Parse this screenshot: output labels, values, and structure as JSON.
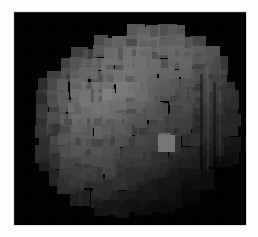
{
  "figure": {
    "kind": "astronomical-image",
    "title": "",
    "caption": "",
    "background_color": "#ffffff",
    "plate_color": "#000000",
    "plate": {
      "x": 14,
      "y": 12,
      "width": 232,
      "height": 213
    },
    "colormap": "grayscale"
  },
  "chart_data": {
    "type": "heatmap",
    "title": "",
    "xlabel": "",
    "ylabel": "",
    "colormap": "grayscale",
    "grid": false,
    "legend": "none",
    "block_size": 11,
    "grid_cols": 21,
    "grid_rows": 19,
    "value_range": [
      0,
      255
    ],
    "values": [
      [
        0,
        0,
        0,
        0,
        0,
        0,
        0,
        0,
        0,
        0,
        0,
        0,
        0,
        0,
        0,
        0,
        0,
        0,
        0,
        0,
        0
      ],
      [
        0,
        0,
        0,
        0,
        0,
        0,
        0,
        0,
        0,
        0,
        96,
        98,
        100,
        96,
        92,
        0,
        0,
        0,
        0,
        0,
        0
      ],
      [
        0,
        0,
        0,
        0,
        0,
        0,
        0,
        86,
        92,
        104,
        108,
        110,
        106,
        104,
        100,
        96,
        88,
        0,
        0,
        0,
        0
      ],
      [
        0,
        0,
        0,
        0,
        0,
        78,
        84,
        96,
        104,
        110,
        112,
        112,
        110,
        108,
        104,
        100,
        94,
        86,
        0,
        0,
        0
      ],
      [
        0,
        0,
        0,
        0,
        72,
        88,
        100,
        108,
        112,
        114,
        116,
        114,
        110,
        106,
        102,
        98,
        92,
        84,
        74,
        0,
        0
      ],
      [
        0,
        0,
        0,
        66,
        84,
        98,
        106,
        112,
        118,
        120,
        118,
        112,
        106,
        100,
        96,
        92,
        86,
        80,
        70,
        0,
        0
      ],
      [
        0,
        0,
        58,
        74,
        92,
        104,
        112,
        118,
        122,
        124,
        118,
        110,
        102,
        96,
        90,
        86,
        80,
        74,
        66,
        56,
        0
      ],
      [
        0,
        0,
        62,
        80,
        96,
        108,
        116,
        124,
        128,
        126,
        116,
        106,
        98,
        90,
        84,
        80,
        74,
        68,
        60,
        52,
        0
      ],
      [
        0,
        0,
        64,
        82,
        98,
        110,
        118,
        120,
        118,
        112,
        104,
        96,
        88,
        82,
        76,
        72,
        66,
        60,
        54,
        46,
        0
      ],
      [
        0,
        0,
        62,
        80,
        96,
        106,
        112,
        112,
        106,
        98,
        92,
        86,
        80,
        74,
        68,
        64,
        58,
        52,
        46,
        40,
        0
      ],
      [
        0,
        0,
        58,
        76,
        90,
        100,
        104,
        102,
        96,
        90,
        84,
        78,
        72,
        68,
        62,
        58,
        52,
        46,
        40,
        34,
        0
      ],
      [
        0,
        0,
        52,
        70,
        84,
        92,
        96,
        94,
        88,
        82,
        76,
        70,
        66,
        118,
        58,
        52,
        46,
        40,
        34,
        28,
        0
      ],
      [
        0,
        0,
        46,
        62,
        76,
        84,
        88,
        86,
        80,
        74,
        68,
        62,
        58,
        54,
        48,
        42,
        36,
        30,
        24,
        20,
        0
      ],
      [
        0,
        0,
        38,
        54,
        66,
        74,
        78,
        76,
        70,
        64,
        58,
        52,
        48,
        44,
        38,
        32,
        26,
        20,
        16,
        0,
        0
      ],
      [
        0,
        0,
        0,
        44,
        56,
        64,
        68,
        66,
        60,
        54,
        48,
        42,
        38,
        34,
        28,
        22,
        18,
        14,
        0,
        0,
        0
      ],
      [
        0,
        0,
        0,
        0,
        44,
        52,
        56,
        54,
        48,
        44,
        38,
        32,
        28,
        24,
        20,
        16,
        12,
        0,
        0,
        0,
        0
      ],
      [
        0,
        0,
        0,
        0,
        0,
        38,
        42,
        40,
        36,
        32,
        28,
        24,
        20,
        16,
        12,
        10,
        0,
        0,
        0,
        0,
        0
      ],
      [
        0,
        0,
        0,
        0,
        0,
        0,
        0,
        24,
        22,
        20,
        18,
        16,
        14,
        10,
        0,
        0,
        0,
        0,
        0,
        0,
        0
      ],
      [
        0,
        0,
        0,
        0,
        0,
        0,
        0,
        0,
        0,
        0,
        0,
        0,
        0,
        0,
        0,
        0,
        0,
        0,
        0,
        0,
        0
      ]
    ]
  },
  "annotations": {
    "bright_block": {
      "row": 11,
      "col": 13,
      "value": 118,
      "label": "bright-spot"
    },
    "limb_striping": {
      "side": "right",
      "label": "vertical-limb-striping"
    }
  }
}
